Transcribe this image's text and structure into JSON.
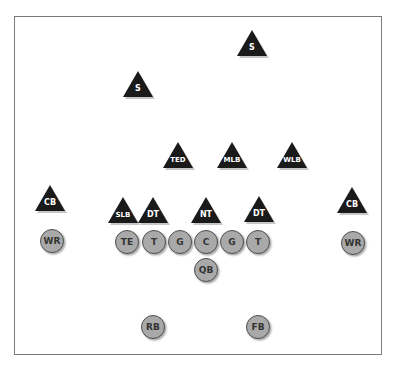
{
  "diagram": {
    "title": "",
    "colors": {
      "defense_fill": "#1a1a1a",
      "defense_text": "#ffffff",
      "offense_fill": "#a9a9a9",
      "offense_border": "#505050",
      "offense_text": "#333333",
      "frame_border": "#7a7a7a"
    },
    "defense": [
      {
        "label": "S",
        "x": 252,
        "y": 30,
        "shape": "triangle"
      },
      {
        "label": "S",
        "x": 138,
        "y": 71,
        "shape": "triangle"
      },
      {
        "label": "TED",
        "x": 178,
        "y": 142,
        "shape": "triangle"
      },
      {
        "label": "MLB",
        "x": 232,
        "y": 142,
        "shape": "triangle"
      },
      {
        "label": "WLB",
        "x": 292,
        "y": 142,
        "shape": "triangle"
      },
      {
        "label": "CB",
        "x": 50,
        "y": 185,
        "shape": "triangle"
      },
      {
        "label": "SLB",
        "x": 123,
        "y": 197,
        "shape": "triangle"
      },
      {
        "label": "DT",
        "x": 153,
        "y": 197,
        "shape": "triangle"
      },
      {
        "label": "NT",
        "x": 206,
        "y": 197,
        "shape": "triangle"
      },
      {
        "label": "DT",
        "x": 259,
        "y": 196,
        "shape": "triangle"
      },
      {
        "label": "CB",
        "x": 352,
        "y": 187,
        "shape": "triangle"
      }
    ],
    "offense": [
      {
        "label": "WR",
        "x": 52,
        "y": 241,
        "shape": "circle"
      },
      {
        "label": "TE",
        "x": 127,
        "y": 242,
        "shape": "circle"
      },
      {
        "label": "T",
        "x": 154,
        "y": 242,
        "shape": "circle"
      },
      {
        "label": "G",
        "x": 180,
        "y": 242,
        "shape": "circle"
      },
      {
        "label": "C",
        "x": 206,
        "y": 242,
        "shape": "circle"
      },
      {
        "label": "G",
        "x": 232,
        "y": 242,
        "shape": "circle"
      },
      {
        "label": "T",
        "x": 258,
        "y": 242,
        "shape": "circle"
      },
      {
        "label": "WR",
        "x": 353,
        "y": 243,
        "shape": "circle"
      },
      {
        "label": "QB",
        "x": 206,
        "y": 270,
        "shape": "circle"
      },
      {
        "label": "RB",
        "x": 153,
        "y": 327,
        "shape": "circle"
      },
      {
        "label": "FB",
        "x": 258,
        "y": 327,
        "shape": "circle"
      }
    ]
  }
}
